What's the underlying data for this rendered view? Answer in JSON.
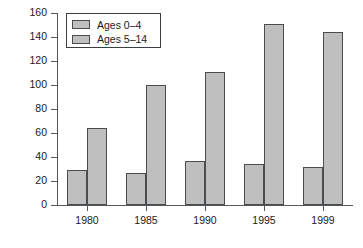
{
  "chart_data": {
    "type": "bar",
    "title": "",
    "xlabel": "",
    "ylabel": "Deaths",
    "categories": [
      "1980",
      "1985",
      "1990",
      "1995",
      "1999"
    ],
    "series": [
      {
        "name": "Ages 0–4",
        "values": [
          29,
          27,
          37,
          34,
          32
        ]
      },
      {
        "name": "Ages 5–14",
        "values": [
          64,
          100,
          111,
          151,
          144
        ]
      }
    ],
    "ylim": [
      0,
      160
    ],
    "yticks": [
      0,
      20,
      40,
      60,
      80,
      100,
      120,
      140,
      160
    ],
    "ytick_labels": [
      "0",
      "20",
      "40",
      "60",
      "80",
      "100",
      "120",
      "140",
      "160"
    ],
    "grid": false,
    "legend_position": "upper-left",
    "bar_fill_color": "#bfbfbf",
    "bar_edge_color": "#4a4d4f",
    "axis_color": "#55585a",
    "background_color": "#ffffff"
  }
}
